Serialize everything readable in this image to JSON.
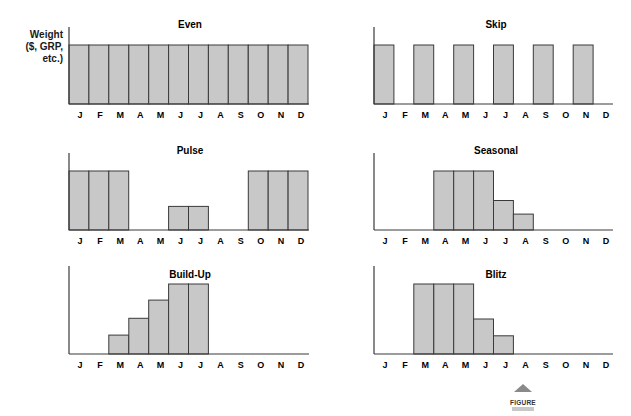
{
  "figure": {
    "label": "FIGURE",
    "ylabel_lines": [
      "Weight",
      "($, GRP,",
      "etc.)"
    ],
    "bar_fill": "#c8c8c8",
    "bar_stroke": "#3a3a3a",
    "axis_color": "#3a3a3a"
  },
  "chart_data": [
    {
      "type": "bar",
      "title": "Even",
      "xlabel": "",
      "ylabel": "Weight ($, GRP, etc.)",
      "categories": [
        "J",
        "F",
        "M",
        "A",
        "M",
        "J",
        "J",
        "A",
        "S",
        "O",
        "N",
        "D"
      ],
      "values": [
        1,
        1,
        1,
        1,
        1,
        1,
        1,
        1,
        1,
        1,
        1,
        1
      ],
      "ylim": [
        0,
        1
      ],
      "grid": false,
      "legend": null
    },
    {
      "type": "bar",
      "title": "Skip",
      "xlabel": "",
      "ylabel": "",
      "categories": [
        "J",
        "F",
        "M",
        "A",
        "M",
        "J",
        "J",
        "A",
        "S",
        "O",
        "N",
        "D"
      ],
      "values": [
        1,
        0,
        1,
        0,
        1,
        0,
        1,
        0,
        1,
        0,
        1,
        0
      ],
      "ylim": [
        0,
        1
      ],
      "grid": false,
      "legend": null
    },
    {
      "type": "bar",
      "title": "Pulse",
      "xlabel": "",
      "ylabel": "",
      "categories": [
        "J",
        "F",
        "M",
        "A",
        "M",
        "J",
        "J",
        "A",
        "S",
        "O",
        "N",
        "D"
      ],
      "values": [
        1,
        1,
        1,
        0,
        0,
        0.4,
        0.4,
        0,
        0,
        1,
        1,
        1
      ],
      "ylim": [
        0,
        1
      ],
      "grid": false,
      "legend": null
    },
    {
      "type": "bar",
      "title": "Seasonal",
      "xlabel": "",
      "ylabel": "",
      "categories": [
        "J",
        "F",
        "M",
        "A",
        "M",
        "J",
        "J",
        "A",
        "S",
        "O",
        "N",
        "D"
      ],
      "values": [
        0,
        0,
        0,
        1,
        1,
        1,
        0.5,
        0.27,
        0,
        0,
        0,
        0
      ],
      "ylim": [
        0,
        1
      ],
      "grid": false,
      "legend": null
    },
    {
      "type": "bar",
      "title": "Build-Up",
      "xlabel": "",
      "ylabel": "",
      "categories": [
        "J",
        "F",
        "M",
        "A",
        "M",
        "J",
        "J",
        "A",
        "S",
        "O",
        "N",
        "D"
      ],
      "values": [
        0,
        0,
        0.27,
        0.51,
        0.77,
        1,
        1,
        0,
        0,
        0,
        0,
        0
      ],
      "ylim": [
        0,
        1
      ],
      "grid": false,
      "legend": null
    },
    {
      "type": "bar",
      "title": "Blitz",
      "xlabel": "",
      "ylabel": "",
      "categories": [
        "J",
        "F",
        "M",
        "A",
        "M",
        "J",
        "J",
        "A",
        "S",
        "O",
        "N",
        "D"
      ],
      "values": [
        0,
        0,
        1,
        1,
        1,
        0.5,
        0.26,
        0,
        0,
        0,
        0,
        0
      ],
      "ylim": [
        0,
        1
      ],
      "grid": false,
      "legend": null
    }
  ]
}
